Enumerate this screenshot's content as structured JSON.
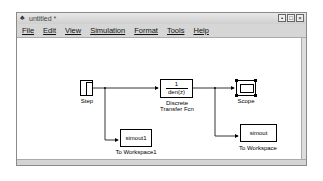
{
  "window": {
    "title": "untitled *",
    "controls": [
      "minimize",
      "maximize",
      "close"
    ]
  },
  "menubar": {
    "items": [
      "File",
      "Edit",
      "View",
      "Simulation",
      "Format",
      "Tools",
      "Help"
    ]
  },
  "blocks": {
    "step": {
      "label": "Step"
    },
    "transfer_fcn": {
      "numerator": "1",
      "denominator": "den(z)",
      "label_line1": "Discrete",
      "label_line2": "Transfer Fcn"
    },
    "scope": {
      "label": "Scope"
    },
    "to_workspace1": {
      "variable": "simout1",
      "label": "To Workspace1"
    },
    "to_workspace": {
      "variable": "simout",
      "label": "To Workspace"
    }
  }
}
